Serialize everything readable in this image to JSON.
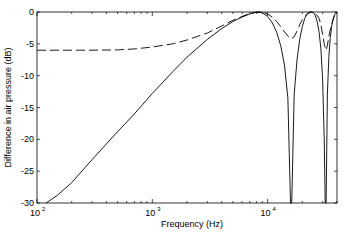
{
  "chart_data": {
    "type": "line",
    "title": "",
    "xlabel": "Frequency (Hz)",
    "ylabel": "Difference in air pressure (dB)",
    "xscale": "log",
    "xlim": [
      100,
      40000
    ],
    "ylim": [
      -30,
      0
    ],
    "grid": false,
    "legend": null,
    "x_ticks": [
      {
        "value": 100,
        "base": "10",
        "exp": "2"
      },
      {
        "value": 1000,
        "base": "10",
        "exp": "3"
      },
      {
        "value": 10000,
        "base": "10",
        "exp": "4"
      }
    ],
    "y_ticks": [
      0,
      -5,
      -10,
      -15,
      -20,
      -25,
      -30
    ],
    "series": [
      {
        "name": "solid",
        "style": "solid",
        "color": "#000000",
        "x": [
          120,
          150,
          200,
          300,
          500,
          700,
          1000,
          1500,
          2000,
          3000,
          4000,
          5000,
          6000,
          7000,
          8000,
          8500,
          9000,
          10000,
          11000,
          12000,
          13000,
          14000,
          15000,
          15800,
          16200,
          17000,
          18000,
          19000,
          20000,
          21000,
          22000,
          23000,
          24000,
          25000,
          26000,
          27000,
          28000,
          29000,
          30000,
          31000,
          31600,
          32200,
          33000,
          34000,
          35000,
          36000,
          37000,
          38000,
          39000,
          40000
        ],
        "y": [
          -30,
          -28.8,
          -26.8,
          -23.2,
          -18.8,
          -16.0,
          -12.8,
          -9.4,
          -7.1,
          -4.3,
          -2.6,
          -1.5,
          -0.8,
          -0.3,
          -0.05,
          0,
          -0.1,
          -0.7,
          -1.7,
          -3.2,
          -5.3,
          -8.3,
          -13.5,
          -30,
          -30,
          -13,
          -7.5,
          -4.3,
          -2.3,
          -1.0,
          -0.3,
          -0.02,
          0,
          -0.1,
          -0.6,
          -1.6,
          -3.2,
          -5.8,
          -10.5,
          -20,
          -30,
          -30,
          -13,
          -7,
          -4,
          -2.2,
          -1.1,
          -0.5,
          -0.2,
          0
        ]
      },
      {
        "name": "dashed",
        "style": "dashed",
        "color": "#000000",
        "x": [
          100,
          200,
          300,
          500,
          700,
          1000,
          1500,
          2000,
          3000,
          4000,
          5000,
          6000,
          7000,
          8000,
          9000,
          10000,
          11000,
          12000,
          13000,
          14000,
          15000,
          16000,
          17000,
          18000,
          19000,
          20000,
          22000,
          24000,
          26000,
          28000,
          29000,
          30000,
          31000,
          32000,
          33000,
          34000,
          36000,
          38000,
          40000
        ],
        "y": [
          -6,
          -6,
          -6,
          -5.95,
          -5.8,
          -5.5,
          -5.0,
          -4.4,
          -3.3,
          -2.2,
          -1.3,
          -0.7,
          -0.25,
          0,
          -0.05,
          -0.3,
          -0.8,
          -1.5,
          -2.3,
          -3.1,
          -3.8,
          -4.2,
          -3.9,
          -3.0,
          -2.0,
          -1.2,
          -0.3,
          0,
          -0.2,
          -1.0,
          -2.0,
          -3.5,
          -5.0,
          -6.0,
          -5.3,
          -3.8,
          -1.8,
          -0.6,
          0
        ]
      }
    ]
  }
}
